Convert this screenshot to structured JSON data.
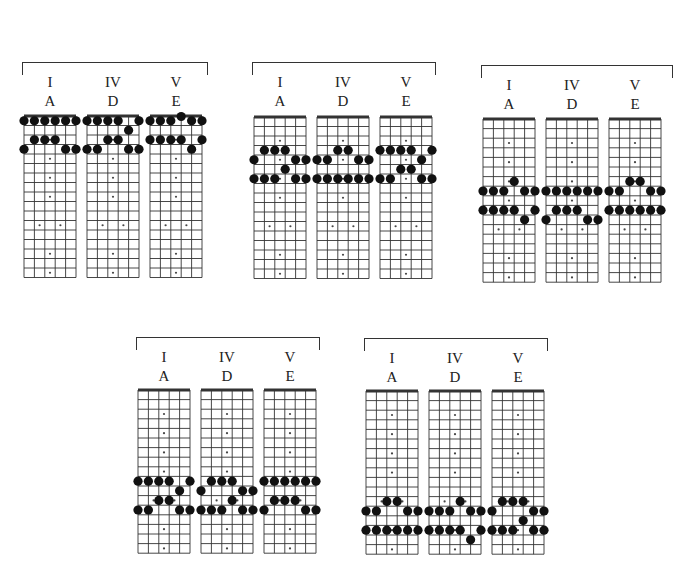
{
  "layout": {
    "frets": 17,
    "strings": 6,
    "fret_markers": [
      3,
      5,
      7,
      9,
      15,
      17
    ],
    "double_marker": 12
  },
  "groups": [
    {
      "id": "position-1",
      "x": 22,
      "y": 62,
      "bracket_width": 184,
      "nut_y": 116,
      "fret_h": 9.5,
      "boards": [
        {
          "x": 24,
          "degree": "I",
          "chord": "A",
          "dots": [
            [
              1,
              1
            ],
            [
              1,
              2
            ],
            [
              1,
              3
            ],
            [
              1,
              4
            ],
            [
              1,
              5
            ],
            [
              1,
              6
            ],
            [
              3,
              2
            ],
            [
              3,
              3
            ],
            [
              3,
              4
            ],
            [
              4,
              1
            ],
            [
              4,
              5
            ],
            [
              4,
              6
            ]
          ]
        },
        {
          "x": 87,
          "degree": "IV",
          "chord": "D",
          "dots": [
            [
              1,
              1
            ],
            [
              1,
              2
            ],
            [
              1,
              3
            ],
            [
              1,
              4
            ],
            [
              1,
              6
            ],
            [
              2,
              5
            ],
            [
              3,
              3
            ],
            [
              3,
              4
            ],
            [
              4,
              1
            ],
            [
              4,
              2
            ],
            [
              4,
              5
            ],
            [
              4,
              6
            ]
          ]
        },
        {
          "x": 150,
          "degree": "V",
          "chord": "E",
          "dots": [
            [
              0,
              4
            ],
            [
              1,
              1
            ],
            [
              1,
              2
            ],
            [
              1,
              3
            ],
            [
              1,
              5
            ],
            [
              1,
              6
            ],
            [
              3,
              1
            ],
            [
              3,
              2
            ],
            [
              3,
              3
            ],
            [
              3,
              4
            ],
            [
              3,
              6
            ],
            [
              4,
              5
            ]
          ]
        }
      ]
    },
    {
      "id": "position-2",
      "x": 252,
      "y": 62,
      "bracket_width": 182,
      "nut_y": 117,
      "fret_h": 9.5,
      "boards": [
        {
          "x": 254,
          "degree": "I",
          "chord": "A",
          "dots": [
            [
              4,
              2
            ],
            [
              4,
              3
            ],
            [
              4,
              4
            ],
            [
              5,
              1
            ],
            [
              5,
              5
            ],
            [
              5,
              6
            ],
            [
              6,
              4
            ],
            [
              7,
              1
            ],
            [
              7,
              2
            ],
            [
              7,
              3
            ],
            [
              7,
              5
            ],
            [
              7,
              6
            ]
          ]
        },
        {
          "x": 317,
          "degree": "IV",
          "chord": "D",
          "dots": [
            [
              4,
              3
            ],
            [
              4,
              4
            ],
            [
              5,
              1
            ],
            [
              5,
              2
            ],
            [
              5,
              5
            ],
            [
              5,
              6
            ],
            [
              7,
              1
            ],
            [
              7,
              2
            ],
            [
              7,
              3
            ],
            [
              7,
              4
            ],
            [
              7,
              5
            ],
            [
              7,
              6
            ]
          ]
        },
        {
          "x": 380,
          "degree": "V",
          "chord": "E",
          "dots": [
            [
              4,
              1
            ],
            [
              4,
              2
            ],
            [
              4,
              3
            ],
            [
              4,
              4
            ],
            [
              4,
              6
            ],
            [
              5,
              5
            ],
            [
              6,
              3
            ],
            [
              6,
              4
            ],
            [
              7,
              1
            ],
            [
              7,
              2
            ],
            [
              7,
              5
            ],
            [
              7,
              6
            ]
          ]
        }
      ]
    },
    {
      "id": "position-3",
      "x": 481,
      "y": 65,
      "bracket_width": 190,
      "nut_y": 119,
      "fret_h": 9.6,
      "boards": [
        {
          "x": 483,
          "degree": "I",
          "chord": "A",
          "dots": [
            [
              7,
              4
            ],
            [
              8,
              1
            ],
            [
              8,
              2
            ],
            [
              8,
              3
            ],
            [
              8,
              5
            ],
            [
              8,
              6
            ],
            [
              10,
              1
            ],
            [
              10,
              2
            ],
            [
              10,
              3
            ],
            [
              10,
              4
            ],
            [
              10,
              6
            ],
            [
              11,
              5
            ]
          ]
        },
        {
          "x": 546,
          "degree": "IV",
          "chord": "D",
          "dots": [
            [
              8,
              1
            ],
            [
              8,
              2
            ],
            [
              8,
              3
            ],
            [
              8,
              4
            ],
            [
              8,
              5
            ],
            [
              8,
              6
            ],
            [
              10,
              2
            ],
            [
              10,
              3
            ],
            [
              10,
              4
            ],
            [
              11,
              1
            ],
            [
              11,
              5
            ],
            [
              11,
              6
            ]
          ]
        },
        {
          "x": 609,
          "degree": "V",
          "chord": "E",
          "dots": [
            [
              7,
              3
            ],
            [
              7,
              4
            ],
            [
              8,
              1
            ],
            [
              8,
              2
            ],
            [
              8,
              5
            ],
            [
              8,
              6
            ],
            [
              10,
              1
            ],
            [
              10,
              2
            ],
            [
              10,
              3
            ],
            [
              10,
              4
            ],
            [
              10,
              5
            ],
            [
              10,
              6
            ]
          ]
        }
      ]
    },
    {
      "id": "position-4",
      "x": 136,
      "y": 337,
      "bracket_width": 182,
      "nut_y": 390,
      "fret_h": 9.6,
      "boards": [
        {
          "x": 138,
          "degree": "I",
          "chord": "A",
          "dots": [
            [
              10,
              1
            ],
            [
              10,
              2
            ],
            [
              10,
              3
            ],
            [
              10,
              4
            ],
            [
              10,
              6
            ],
            [
              11,
              5
            ],
            [
              12,
              3
            ],
            [
              12,
              4
            ],
            [
              13,
              1
            ],
            [
              13,
              2
            ],
            [
              13,
              5
            ],
            [
              13,
              6
            ]
          ]
        },
        {
          "x": 201,
          "degree": "IV",
          "chord": "D",
          "dots": [
            [
              10,
              2
            ],
            [
              10,
              3
            ],
            [
              10,
              4
            ],
            [
              11,
              1
            ],
            [
              11,
              5
            ],
            [
              11,
              6
            ],
            [
              12,
              4
            ],
            [
              13,
              1
            ],
            [
              13,
              2
            ],
            [
              13,
              3
            ],
            [
              13,
              5
            ],
            [
              13,
              6
            ]
          ]
        },
        {
          "x": 264,
          "degree": "V",
          "chord": "E",
          "dots": [
            [
              10,
              1
            ],
            [
              10,
              2
            ],
            [
              10,
              3
            ],
            [
              10,
              4
            ],
            [
              10,
              5
            ],
            [
              10,
              6
            ],
            [
              12,
              2
            ],
            [
              12,
              3
            ],
            [
              12,
              4
            ],
            [
              13,
              1
            ],
            [
              13,
              5
            ],
            [
              13,
              6
            ]
          ]
        }
      ]
    },
    {
      "id": "position-5",
      "x": 364,
      "y": 338,
      "bracket_width": 182,
      "nut_y": 391,
      "fret_h": 9.6,
      "boards": [
        {
          "x": 366,
          "degree": "I",
          "chord": "A",
          "dots": [
            [
              12,
              3
            ],
            [
              12,
              4
            ],
            [
              13,
              1
            ],
            [
              13,
              2
            ],
            [
              13,
              5
            ],
            [
              13,
              6
            ],
            [
              15,
              1
            ],
            [
              15,
              2
            ],
            [
              15,
              3
            ],
            [
              15,
              4
            ],
            [
              15,
              5
            ],
            [
              15,
              6
            ]
          ]
        },
        {
          "x": 429,
          "degree": "IV",
          "chord": "D",
          "dots": [
            [
              12,
              4
            ],
            [
              13,
              1
            ],
            [
              13,
              2
            ],
            [
              13,
              3
            ],
            [
              13,
              5
            ],
            [
              13,
              6
            ],
            [
              15,
              1
            ],
            [
              15,
              2
            ],
            [
              15,
              3
            ],
            [
              15,
              4
            ],
            [
              15,
              6
            ],
            [
              16,
              5
            ]
          ]
        },
        {
          "x": 492,
          "degree": "V",
          "chord": "E",
          "dots": [
            [
              12,
              2
            ],
            [
              12,
              3
            ],
            [
              12,
              4
            ],
            [
              13,
              1
            ],
            [
              13,
              5
            ],
            [
              13,
              6
            ],
            [
              14,
              4
            ],
            [
              15,
              1
            ],
            [
              15,
              2
            ],
            [
              15,
              3
            ],
            [
              15,
              5
            ],
            [
              15,
              6
            ]
          ]
        }
      ]
    }
  ]
}
